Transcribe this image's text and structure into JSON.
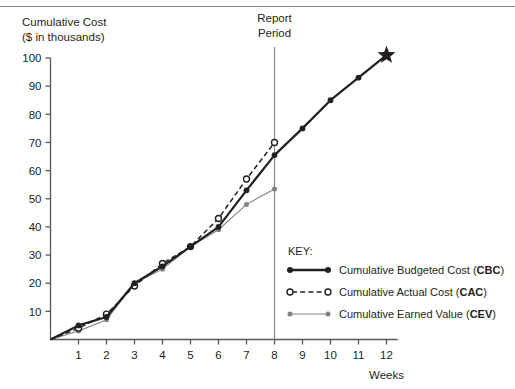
{
  "figure": {
    "name": "cumulative-cost-earned-value-chart",
    "top_rule_color": "#8a8a8a",
    "background": "#ffffff"
  },
  "axes": {
    "y_title_line1": "Cumulative Cost",
    "y_title_line2": "($ in thousands)",
    "x_title": "Weeks",
    "y_ticks": [
      10,
      20,
      30,
      40,
      50,
      60,
      70,
      80,
      90,
      100
    ],
    "x_ticks": [
      1,
      2,
      3,
      4,
      5,
      6,
      7,
      8,
      9,
      10,
      11,
      12
    ],
    "ylim": [
      0,
      100
    ],
    "xlim": [
      0,
      12.4
    ],
    "axis_color": "#58595b",
    "grid": "off"
  },
  "annotations": {
    "report_period_line1": "Report",
    "report_period_line2": "Period",
    "report_period_week": 8,
    "report_period_color": "#8a8a8a",
    "end_marker": "star",
    "end_marker_week": 12,
    "end_marker_value": 101
  },
  "legend": {
    "title": "KEY:",
    "position": "inside-lower-right",
    "entries": [
      {
        "label_main": "Cumulative Budgeted Cost (",
        "abbr": "CBC",
        "label_tail": ")",
        "style": "solid-filled",
        "color": "#231f20"
      },
      {
        "label_main": "Cumulative Actual Cost (",
        "abbr": "CAC",
        "label_tail": ")",
        "style": "dashed-open",
        "color": "#231f20"
      },
      {
        "label_main": "Cumulative Earned Value (",
        "abbr": "CEV",
        "label_tail": ")",
        "style": "solid-thin-filled",
        "color": "#808285"
      }
    ]
  },
  "chart_data": {
    "type": "line",
    "title": "",
    "xlabel": "Weeks",
    "ylabel": "Cumulative Cost ($ in thousands)",
    "xlim": [
      0,
      12.4
    ],
    "ylim": [
      0,
      100
    ],
    "grid": false,
    "legend_position": "inside-lower-right",
    "x": [
      0,
      1,
      2,
      3,
      4,
      5,
      6,
      7,
      8,
      9,
      10,
      11,
      12
    ],
    "series": [
      {
        "name": "Cumulative Budgeted Cost (CBC)",
        "abbr": "CBC",
        "color": "#231f20",
        "line": "solid",
        "marker": "filled-circle",
        "values": [
          0,
          5,
          8,
          20,
          26,
          33,
          40,
          53,
          65.5,
          75,
          85,
          93,
          101
        ]
      },
      {
        "name": "Cumulative Actual Cost (CAC)",
        "abbr": "CAC",
        "color": "#231f20",
        "line": "dashed",
        "marker": "open-circle",
        "values": [
          0,
          4,
          9,
          19,
          27,
          33,
          43,
          57,
          70,
          null,
          null,
          null,
          null
        ]
      },
      {
        "name": "Cumulative Earned Value (CEV)",
        "abbr": "CEV",
        "color": "#808285",
        "line": "solid-thin",
        "marker": "filled-circle-small",
        "values": [
          0,
          3,
          7,
          20,
          25,
          33,
          39,
          48,
          53.5,
          null,
          null,
          null,
          null
        ]
      }
    ]
  }
}
